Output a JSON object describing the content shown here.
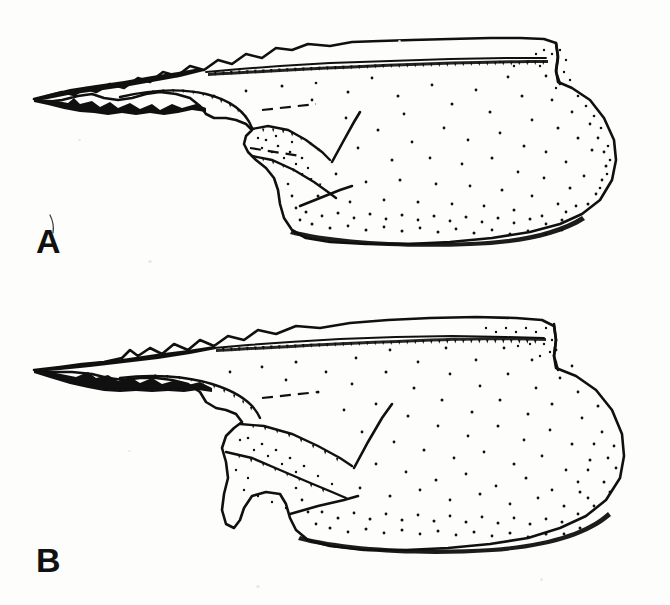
{
  "document": {
    "type": "scientific-line-illustration",
    "medium": "ink drawing with stipple shading",
    "background_color": "#fdfdfc",
    "ink_color": "#101010",
    "width": 670,
    "height": 605
  },
  "figure": {
    "panel_count": 2,
    "panels": [
      {
        "id": "A",
        "label": "A",
        "label_x": 36,
        "label_y": 224,
        "description": "Dorsal-lateral view of a sclerotized appendage with a serrated dorsal margin, forked anterior spine, internal articulating ridges shown with broken lines, and a broad rounded posterior body bearing dense punctate stippling.",
        "artifact": "thin curved hair-line scratch above the letter A",
        "bounds": {
          "x": 30,
          "y": 35,
          "width": 608,
          "height": 215
        }
      },
      {
        "id": "B",
        "label": "B",
        "label_x": 36,
        "label_y": 543,
        "description": "Companion view of the same structure with a longer narrow anterior spine, a more angular ventral articulation, and a broader rounded posterior body with dense marginal stippling.",
        "artifact": "none",
        "bounds": {
          "x": 30,
          "y": 318,
          "width": 608,
          "height": 245
        }
      }
    ],
    "shared_features": [
      "serrated / stepped dorsal margin",
      "fine tooth hatching along inner margin line",
      "forked anterior apical spine",
      "broken (dashed) lines indicating concealed internal ridges",
      "graded stipple shading, densest at ventral and posterior margins",
      "posterior notch producing a shouldered outline"
    ]
  },
  "labels": {
    "panel_a": "A",
    "panel_b": "B"
  },
  "colors": {
    "ink": "#101010",
    "paper": "#fdfdfc",
    "paper_shadow": "#f1f1ef",
    "speck": "#e9e9e7"
  }
}
